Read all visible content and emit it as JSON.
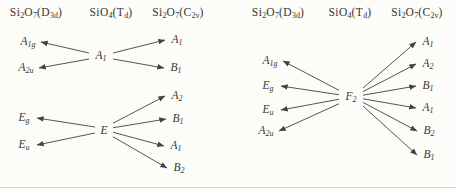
{
  "figure": {
    "type": "correlation-diagram"
  },
  "colors": {
    "background": "#fcfcf9",
    "text": "#38352f",
    "arrow": "#45423c",
    "edge_line": "#d7d7d3"
  },
  "panels": [
    {
      "name": "left-diagram",
      "headers": [
        {
          "segments": [
            {
              "t": "Si"
            },
            {
              "t": "2",
              "sub": true
            },
            {
              "t": "O"
            },
            {
              "t": "7",
              "sub": true
            },
            {
              "t": "(D"
            },
            {
              "t": "3d",
              "sub": true
            },
            {
              "t": ")"
            }
          ]
        },
        {
          "segments": [
            {
              "t": "SiO"
            },
            {
              "t": "4",
              "sub": true
            },
            {
              "t": "(T"
            },
            {
              "t": "d",
              "sub": true
            },
            {
              "t": ")"
            }
          ]
        },
        {
          "segments": [
            {
              "t": "Si"
            },
            {
              "t": "2",
              "sub": true
            },
            {
              "t": "O"
            },
            {
              "t": "7",
              "sub": true
            },
            {
              "t": "(C"
            },
            {
              "t": "2v",
              "sub": true
            },
            {
              "t": ")"
            }
          ]
        }
      ],
      "groups": [
        {
          "center": {
            "m": "A",
            "s": "1"
          },
          "left": [
            {
              "m": "A",
              "s": "1g"
            },
            {
              "m": "A",
              "s": "2u"
            }
          ],
          "right": [
            {
              "m": "A",
              "s": "1"
            },
            {
              "m": "B",
              "s": "1"
            }
          ]
        },
        {
          "center": {
            "m": "E",
            "s": ""
          },
          "left": [
            {
              "m": "E",
              "s": "g"
            },
            {
              "m": "E",
              "s": "u"
            }
          ],
          "right": [
            {
              "m": "A",
              "s": "2"
            },
            {
              "m": "B",
              "s": "1"
            },
            {
              "m": "A",
              "s": "1"
            },
            {
              "m": "B",
              "s": "2"
            }
          ]
        }
      ]
    },
    {
      "name": "right-diagram",
      "headers": [
        {
          "segments": [
            {
              "t": "Si"
            },
            {
              "t": "2",
              "sub": true
            },
            {
              "t": "O"
            },
            {
              "t": "7",
              "sub": true
            },
            {
              "t": "(D"
            },
            {
              "t": "3d",
              "sub": true
            },
            {
              "t": ")"
            }
          ]
        },
        {
          "segments": [
            {
              "t": "SiO"
            },
            {
              "t": "4",
              "sub": true
            },
            {
              "t": "(T"
            },
            {
              "t": "d",
              "sub": true
            },
            {
              "t": ")"
            }
          ]
        },
        {
          "segments": [
            {
              "t": "Si"
            },
            {
              "t": "2",
              "sub": true
            },
            {
              "t": "O"
            },
            {
              "t": "7",
              "sub": true
            },
            {
              "t": "(C"
            },
            {
              "t": "2v",
              "sub": true
            },
            {
              "t": ")"
            }
          ]
        }
      ],
      "groups": [
        {
          "center": {
            "m": "F",
            "s": "2"
          },
          "left": [
            {
              "m": "A",
              "s": "1g"
            },
            {
              "m": "E",
              "s": "g"
            },
            {
              "m": "E",
              "s": "u"
            },
            {
              "m": "A",
              "s": "2u"
            }
          ],
          "right": [
            {
              "m": "A",
              "s": "1"
            },
            {
              "m": "A",
              "s": "2"
            },
            {
              "m": "B",
              "s": "1"
            },
            {
              "m": "A",
              "s": "1"
            },
            {
              "m": "B",
              "s": "2"
            },
            {
              "m": "B",
              "s": "1"
            }
          ]
        }
      ]
    }
  ]
}
